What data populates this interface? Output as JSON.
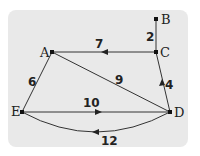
{
  "diagram": {
    "type": "weighted-directed-graph",
    "background": "#e9e9e9",
    "nodes": [
      {
        "id": "A",
        "label": "A",
        "x": 52,
        "y": 52
      },
      {
        "id": "B",
        "label": "B",
        "x": 156,
        "y": 19
      },
      {
        "id": "C",
        "label": "C",
        "x": 156,
        "y": 52
      },
      {
        "id": "D",
        "label": "D",
        "x": 170,
        "y": 112
      },
      {
        "id": "E",
        "label": "E",
        "x": 22,
        "y": 112
      }
    ],
    "edges": [
      {
        "from": "B",
        "to": "C",
        "weight": "2",
        "directed": false
      },
      {
        "from": "C",
        "to": "A",
        "weight": "7",
        "directed": true
      },
      {
        "from": "A",
        "to": "D",
        "weight": "9",
        "directed": false
      },
      {
        "from": "A",
        "to": "E",
        "weight": "6",
        "directed": false
      },
      {
        "from": "D",
        "to": "C",
        "weight": "4",
        "directed": true
      },
      {
        "from": "E",
        "to": "D",
        "weight": "10",
        "directed": true
      },
      {
        "from": "D",
        "to": "E",
        "weight": "12",
        "directed": true,
        "curved": true
      }
    ]
  }
}
